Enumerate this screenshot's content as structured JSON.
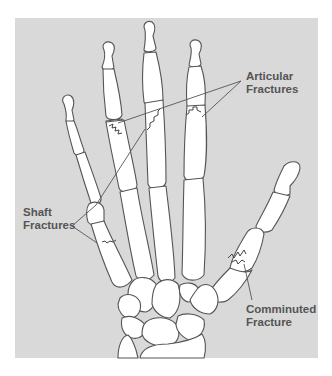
{
  "figure": {
    "type": "anatomical-illustration",
    "background_color": "#d9d9d9",
    "bone_fill": "#ffffff",
    "outline_color": "#555555",
    "label_color": "#555555"
  },
  "labels": {
    "articular": {
      "line1": "Articular",
      "line2": "Fractures"
    },
    "shaft": {
      "line1": "Shaft",
      "line2": "Fractures"
    },
    "comminuted": {
      "line1": "Comminuted",
      "line2": "Fracture"
    }
  }
}
